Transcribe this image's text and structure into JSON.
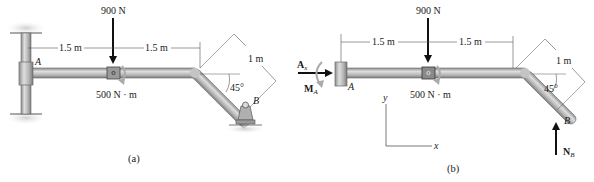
{
  "figure_a": {
    "caption": "(a)",
    "force_label": "900 N",
    "moment_label": "500 N · m",
    "dim_left": "1.5 m",
    "dim_right": "1.5 m",
    "dim_incline": "1 m",
    "angle": "45°",
    "point_a": "A",
    "point_b": "B"
  },
  "figure_b": {
    "caption": "(b)",
    "force_label": "900 N",
    "moment_label": "500 N · m",
    "dim_left": "1.5 m",
    "dim_right": "1.5 m",
    "dim_incline": "1 m",
    "angle": "45°",
    "point_a": "A",
    "point_b": "B",
    "reaction_ax": "A",
    "reaction_ax_sub": "x",
    "reaction_ma": "M",
    "reaction_ma_sub": "A",
    "reaction_nb": "N",
    "reaction_nb_sub": "B",
    "axis_x": "x",
    "axis_y": "y"
  },
  "colors": {
    "pipe_fill": "#b9b9b9",
    "pipe_light": "#dcdcdc",
    "pipe_dark": "#8a8a8a",
    "ground": "#d9d9d9",
    "ink": "#1a1a1a",
    "dim_line": "#555555"
  }
}
